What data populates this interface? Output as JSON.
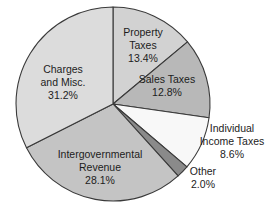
{
  "chart_data": {
    "type": "pie",
    "title": "",
    "subtitle": "",
    "xlabel": "",
    "ylabel": "",
    "legend_position": "none",
    "grid": false,
    "labels_inline": true,
    "start_angle_deg": 0,
    "direction": "clockwise",
    "categories": [
      "Property Taxes",
      "Sales Taxes",
      "Individual Income Taxes",
      "Other",
      "Intergovernmental Revenue",
      "Charges and Misc."
    ],
    "values": [
      13.4,
      12.8,
      8.6,
      2.0,
      28.1,
      31.2
    ],
    "units": "percent",
    "slices": [
      {
        "name": "Property Taxes",
        "label_line1": "Property",
        "label_line2": "Taxes",
        "value": 13.4,
        "value_label": "13.4%",
        "color": "#d2d2d2",
        "label_placement": "inside"
      },
      {
        "name": "Sales Taxes",
        "label_line1": "Sales Taxes",
        "label_line2": "",
        "value": 12.8,
        "value_label": "12.8%",
        "color": "#b8b8b8",
        "label_placement": "inside"
      },
      {
        "name": "Individual Income Taxes",
        "label_line1": "Individual",
        "label_line2": "Income Taxes",
        "value": 8.6,
        "value_label": "8.6%",
        "color": "#f8f8f8",
        "label_placement": "outside"
      },
      {
        "name": "Other",
        "label_line1": "Other",
        "label_line2": "",
        "value": 2.0,
        "value_label": "2.0%",
        "color": "#8a8a8a",
        "label_placement": "outside"
      },
      {
        "name": "Intergovernmental Revenue",
        "label_line1": "Intergovernmental",
        "label_line2": "Revenue",
        "value": 28.1,
        "value_label": "28.1%",
        "color": "#c4c4c4",
        "label_placement": "inside"
      },
      {
        "name": "Charges and Misc.",
        "label_line1": "Charges",
        "label_line2": "and Misc.",
        "value": 31.2,
        "value_label": "31.2%",
        "color": "#dcdcdc",
        "label_placement": "inside"
      }
    ]
  }
}
